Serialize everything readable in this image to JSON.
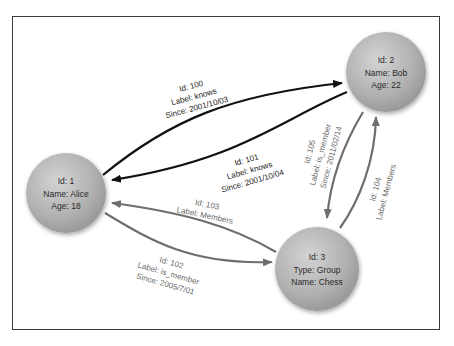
{
  "nodes": [
    {
      "id": "1",
      "lines": [
        "Id: 1",
        "Name: Alice",
        "Age: 18"
      ]
    },
    {
      "id": "2",
      "lines": [
        "Id: 2",
        "Name: Bob",
        "Age: 22"
      ]
    },
    {
      "id": "3",
      "lines": [
        "Id: 3",
        "Type: Group",
        "Name: Chess"
      ]
    }
  ],
  "edges": [
    {
      "id": "100",
      "from": "1",
      "to": "2",
      "lines": [
        "Id: 100",
        "Label: knows",
        "Since: 2001/10/03"
      ]
    },
    {
      "id": "101",
      "from": "2",
      "to": "1",
      "lines": [
        "Id: 101",
        "Label: knows",
        "Since: 2001/10/04"
      ]
    },
    {
      "id": "102",
      "from": "1",
      "to": "3",
      "lines": [
        "Id: 102",
        "Label: is_member",
        "Since: 2005/7/01"
      ]
    },
    {
      "id": "103",
      "from": "3",
      "to": "1",
      "lines": [
        "Id: 103",
        "Label: Members"
      ]
    },
    {
      "id": "104",
      "from": "3",
      "to": "2",
      "lines": [
        "Id: 104",
        "Label: Members"
      ]
    },
    {
      "id": "105",
      "from": "2",
      "to": "3",
      "lines": [
        "Id: 105",
        "Label: is_member",
        "Since: 2011/02/14"
      ]
    }
  ],
  "colors": {
    "node_fill": "#b5b5b5",
    "edge_knows": "#111111",
    "edge_membership": "#6e6e6e",
    "frame": "#3a3a3a"
  }
}
